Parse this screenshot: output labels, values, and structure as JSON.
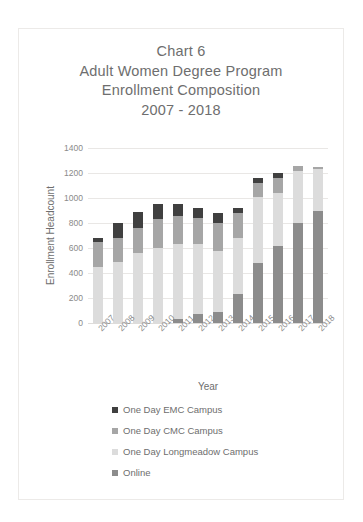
{
  "chart_data": {
    "type": "bar",
    "stacked": true,
    "title": "Chart 6\nAdult Women Degree Program\nEnrollment Composition\n2007 - 2018",
    "title_lines": [
      "Chart 6",
      "Adult Women Degree Program",
      "Enrollment Composition",
      "2007 - 2018"
    ],
    "xlabel": "Year",
    "ylabel": "Enrollment Headcount",
    "ylim": [
      0,
      1400
    ],
    "yticks": [
      1400,
      1200,
      1000,
      800,
      600,
      400,
      200,
      0
    ],
    "ytick_labels": [
      "1400",
      "1200",
      "1000",
      "800",
      "600",
      "400",
      "200",
      "0"
    ],
    "grid": true,
    "legend_position": "bottom",
    "categories": [
      "2007",
      "2008",
      "2009",
      "2010",
      "2011",
      "2012",
      "2013",
      "2014",
      "2015",
      "2016",
      "2017",
      "2018"
    ],
    "series": [
      {
        "name": "Online",
        "color": "#8c8c8c",
        "values": [
          0,
          0,
          0,
          0,
          30,
          70,
          90,
          230,
          480,
          620,
          800,
          900
        ]
      },
      {
        "name": "One Day Longmeadow Campus",
        "color": "#dcdcdc",
        "values": [
          450,
          490,
          560,
          600,
          600,
          560,
          490,
          450,
          530,
          420,
          420,
          330
        ]
      },
      {
        "name": "One Day CMC Campus",
        "color": "#a6a6a6",
        "values": [
          200,
          190,
          200,
          230,
          230,
          210,
          220,
          200,
          110,
          120,
          40,
          20
        ]
      },
      {
        "name": "One Day EMC Campus",
        "color": "#404040",
        "values": [
          30,
          120,
          130,
          120,
          90,
          80,
          80,
          40,
          40,
          40,
          0,
          0
        ]
      }
    ],
    "stack_order_bottom_to_top": [
      "Online",
      "One Day Longmeadow Campus",
      "One Day CMC Campus",
      "One Day EMC Campus"
    ],
    "totals": [
      680,
      800,
      890,
      950,
      950,
      920,
      880,
      920,
      1160,
      1200,
      1260,
      1250
    ]
  },
  "legend": {
    "items": [
      {
        "label": "One Day EMC Campus",
        "color": "#404040"
      },
      {
        "label": "One Day CMC Campus",
        "color": "#a6a6a6"
      },
      {
        "label": "One Day Longmeadow Campus",
        "color": "#dcdcdc"
      },
      {
        "label": "Online",
        "color": "#8c8c8c"
      }
    ]
  },
  "colors": {
    "background": "#ffffff",
    "frame_border": "#eceae8",
    "grid": "#e9e7e5",
    "text": "#6e6e6e",
    "tick_text": "#8a8a8a"
  }
}
